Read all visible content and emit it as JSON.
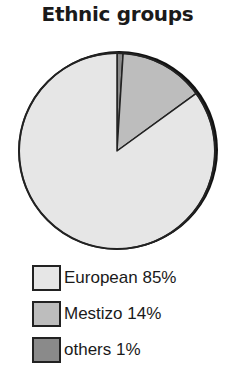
{
  "chart_data": {
    "type": "pie",
    "title": "Ethnic groups",
    "categories": [
      "European",
      "Mestizo",
      "others"
    ],
    "values": [
      85,
      14,
      1
    ],
    "unit": "%",
    "legend_labels": [
      "European 85%",
      "Mestizo 14%",
      "others 1%"
    ],
    "colors": [
      "#e6e6e6",
      "#bdbdbd",
      "#8a8a8a"
    ],
    "legend_position": "bottom",
    "start_angle_deg": 0,
    "direction": "clockwise",
    "slice_order": [
      "others",
      "Mestizo",
      "European"
    ]
  },
  "legend": {
    "items": [
      {
        "label": "European 85%",
        "color": "#e6e6e6"
      },
      {
        "label": "Mestizo 14%",
        "color": "#bdbdbd"
      },
      {
        "label": "others 1%",
        "color": "#8a8a8a"
      }
    ]
  }
}
